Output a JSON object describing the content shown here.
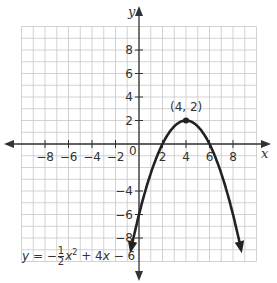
{
  "chart_data": {
    "type": "line",
    "title": "",
    "xlabel": "x",
    "ylabel": "y",
    "xlim": [
      -10,
      10
    ],
    "ylim": [
      -10,
      10
    ],
    "grid": true,
    "x_ticks": [
      "-8",
      "-6",
      "-4",
      "-2",
      "2",
      "4",
      "6",
      "8"
    ],
    "y_ticks": [
      "8",
      "6",
      "4",
      "2",
      "-4",
      "-6",
      "-8"
    ],
    "origin_label": "0",
    "series": [
      {
        "name": "y = -1/2 x^2 + 4x - 6",
        "equation": "y = -½x² + 4x - 6",
        "x": [
          -0.7,
          0,
          1,
          2,
          3,
          4,
          5,
          6,
          7,
          8,
          8.7
        ],
        "values": [
          -9.0,
          -6,
          -2.5,
          0,
          1.5,
          2,
          1.5,
          0,
          -2.5,
          -6,
          -9.0
        ]
      }
    ],
    "annotations": [
      {
        "text": "(4, 2)",
        "x": 4,
        "y": 2,
        "type": "vertex"
      }
    ]
  },
  "labels": {
    "x_axis": "x",
    "y_axis": "y",
    "origin": "0",
    "vertex": "(4, 2)",
    "eq_y": "y",
    "eq_eq": " = −",
    "eq_num": "1",
    "eq_den": "2",
    "eq_rest_x": "x",
    "eq_sup": "2",
    "eq_tail": " + 4",
    "eq_x2": "x",
    "eq_end": " − 6"
  }
}
